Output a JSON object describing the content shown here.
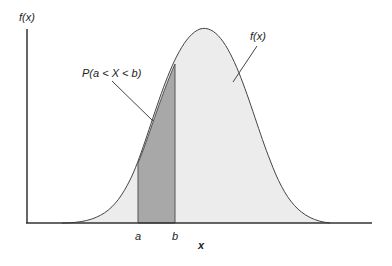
{
  "diagram": {
    "y_axis_label": "f(x)",
    "curve_label": "f(x)",
    "area_label": "P(a < X < b)",
    "x_axis_label": "x",
    "tick_a": "a",
    "tick_b": "b",
    "colors": {
      "curve_fill": "#ececec",
      "shaded_area": "#a8a8a8",
      "lines": "#444444"
    }
  }
}
